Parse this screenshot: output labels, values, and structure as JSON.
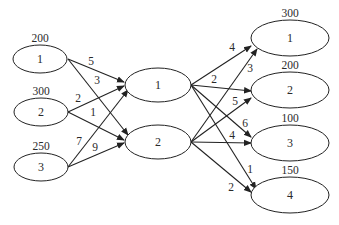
{
  "diagram": {
    "type": "transportation-network",
    "colors": {
      "stroke": "#222222",
      "text": "#2a2a2a",
      "background": "#ffffff"
    },
    "sources": [
      {
        "id": "S1",
        "label": "1",
        "supply": "200",
        "cx": 40,
        "cy": 59,
        "rx": 27,
        "ry": 14
      },
      {
        "id": "S2",
        "label": "2",
        "supply": "300",
        "cx": 41,
        "cy": 112,
        "rx": 27,
        "ry": 14
      },
      {
        "id": "S3",
        "label": "3",
        "supply": "250",
        "cx": 41,
        "cy": 167,
        "rx": 27,
        "ry": 14
      }
    ],
    "transshipment": [
      {
        "id": "T1",
        "label": "1",
        "cx": 158,
        "cy": 85,
        "rx": 33,
        "ry": 17
      },
      {
        "id": "T2",
        "label": "2",
        "cx": 158,
        "cy": 142,
        "rx": 33,
        "ry": 17
      }
    ],
    "destinations": [
      {
        "id": "D1",
        "label": "1",
        "demand": "300",
        "cx": 290,
        "cy": 38,
        "rx": 39,
        "ry": 18
      },
      {
        "id": "D2",
        "label": "2",
        "demand": "200",
        "cx": 290,
        "cy": 90,
        "rx": 39,
        "ry": 18
      },
      {
        "id": "D3",
        "label": "3",
        "demand": "100",
        "cx": 290,
        "cy": 143,
        "rx": 39,
        "ry": 18
      },
      {
        "id": "D4",
        "label": "4",
        "demand": "150",
        "cx": 290,
        "cy": 195,
        "rx": 39,
        "ry": 18
      }
    ],
    "edges": [
      {
        "from": "S1",
        "to": "T1",
        "cost": "5",
        "x1": 68,
        "y1": 59,
        "x2": 124,
        "y2": 82,
        "lx": 91,
        "ly": 65
      },
      {
        "from": "S1",
        "to": "T2",
        "cost": "3",
        "x1": 68,
        "y1": 59,
        "x2": 128,
        "y2": 135,
        "lx": 97,
        "ly": 84
      },
      {
        "from": "S2",
        "to": "T1",
        "cost": "2",
        "x1": 68,
        "y1": 112,
        "x2": 124,
        "y2": 86,
        "lx": 78,
        "ly": 102
      },
      {
        "from": "S2",
        "to": "T2",
        "cost": "1",
        "x1": 68,
        "y1": 112,
        "x2": 124,
        "y2": 140,
        "lx": 93,
        "ly": 116
      },
      {
        "from": "S3",
        "to": "T1",
        "cost": "7",
        "x1": 68,
        "y1": 167,
        "x2": 128,
        "y2": 90,
        "lx": 79,
        "ly": 145
      },
      {
        "from": "S3",
        "to": "T2",
        "cost": "9",
        "x1": 68,
        "y1": 167,
        "x2": 124,
        "y2": 143,
        "lx": 95,
        "ly": 151
      },
      {
        "from": "T1",
        "to": "D1",
        "cost": "4",
        "x1": 191,
        "y1": 85,
        "x2": 251,
        "y2": 46,
        "lx": 232,
        "ly": 51
      },
      {
        "from": "T1",
        "to": "D2",
        "cost": "2",
        "x1": 191,
        "y1": 85,
        "x2": 251,
        "y2": 91,
        "lx": 214,
        "ly": 83
      },
      {
        "from": "T1",
        "to": "D3",
        "cost": "6",
        "x1": 191,
        "y1": 85,
        "x2": 251,
        "y2": 137,
        "lx": 245,
        "ly": 127
      },
      {
        "from": "T1",
        "to": "D4",
        "cost": "1",
        "x1": 191,
        "y1": 85,
        "x2": 256,
        "y2": 189,
        "lx": 250,
        "ly": 173
      },
      {
        "from": "T2",
        "to": "D1",
        "cost": "3",
        "x1": 191,
        "y1": 142,
        "x2": 257,
        "y2": 49,
        "lx": 250,
        "ly": 72
      },
      {
        "from": "T2",
        "to": "D2",
        "cost": "5",
        "x1": 191,
        "y1": 142,
        "x2": 251,
        "y2": 98,
        "lx": 235,
        "ly": 105
      },
      {
        "from": "T2",
        "to": "D3",
        "cost": "4",
        "x1": 191,
        "y1": 142,
        "x2": 251,
        "y2": 143,
        "lx": 232,
        "ly": 139
      },
      {
        "from": "T2",
        "to": "D4",
        "cost": "2",
        "x1": 191,
        "y1": 142,
        "x2": 251,
        "y2": 192,
        "lx": 231,
        "ly": 191
      }
    ]
  }
}
